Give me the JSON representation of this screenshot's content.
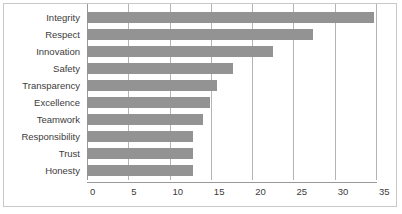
{
  "chart_data": {
    "type": "bar",
    "orientation": "horizontal",
    "title": "",
    "subtitle": "",
    "xlabel": "",
    "ylabel": "",
    "categories": [
      "Integrity",
      "Respect",
      "Innovation",
      "Safety",
      "Transparency",
      "Excellence",
      "Teamwork",
      "Responsibility",
      "Trust",
      "Honesty"
    ],
    "values": [
      34.8,
      27.4,
      22.5,
      17.7,
      15.7,
      14.9,
      14.0,
      12.8,
      12.8,
      12.8
    ],
    "xlim": [
      0,
      35
    ],
    "xticks": [
      0,
      5,
      10,
      15,
      20,
      25,
      30,
      35
    ],
    "xtick_labels": [
      "0",
      "5",
      "10",
      "15",
      "20",
      "25",
      "30",
      "35"
    ],
    "grid": true,
    "grid_axis": "x",
    "legend": false,
    "legend_position": "none",
    "series": [
      {
        "name": "",
        "values": [
          34.8,
          27.4,
          22.5,
          17.7,
          15.7,
          14.9,
          14.0,
          12.8,
          12.8,
          12.8
        ]
      }
    ]
  },
  "colors": {
    "bar": "#939393",
    "gridline": "#b4b4b4",
    "axis": "#9a9a9a",
    "frame_border": "#c9c9c9",
    "text": "#3c3c3c",
    "background": "#ffffff"
  }
}
